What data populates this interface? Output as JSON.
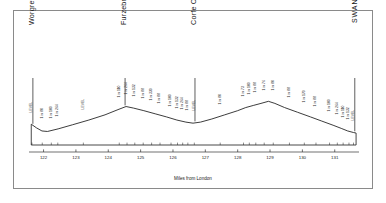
{
  "figure": {
    "background_color": "#ffffff",
    "line_color": "#1a1a1a",
    "border_color": "#8a8a8a"
  },
  "chart_data": {
    "type": "line",
    "title": "",
    "subtitle": "",
    "xlabel": "Miles from London",
    "ylabel": "",
    "grid": false,
    "legend": "none",
    "xlim": [
      121.55,
      131.75
    ],
    "ylim": [
      0,
      120
    ],
    "xticks": [
      "122",
      "123",
      "124",
      "125",
      "126",
      "127",
      "128",
      "129",
      "130",
      "131"
    ],
    "xtick_values": [
      122,
      123,
      124,
      125,
      126,
      127,
      128,
      129,
      130,
      131
    ],
    "series": [
      {
        "name": "Track level",
        "x": [
          121.62,
          121.78,
          121.95,
          122.12,
          122.45,
          122.9,
          123.4,
          123.9,
          124.3,
          124.55,
          124.78,
          125.1,
          125.45,
          125.8,
          126.12,
          126.4,
          126.62,
          126.85,
          127.2,
          127.6,
          128.0,
          128.25,
          128.48,
          128.72,
          128.95,
          129.15,
          129.45,
          129.85,
          130.25,
          130.6,
          130.95,
          131.2,
          131.4,
          131.58,
          131.66
        ],
        "y": [
          40,
          33,
          27,
          26,
          31,
          39,
          48,
          58,
          68,
          74,
          71,
          66,
          60,
          54,
          48,
          44,
          42,
          44,
          50,
          58,
          66,
          72,
          76,
          80,
          84,
          80,
          72,
          63,
          54,
          46,
          38,
          32,
          27,
          24,
          23
        ]
      }
    ],
    "stations": [
      {
        "name": "Worgret Junction",
        "mile": 121.67,
        "style": "title"
      },
      {
        "name": "Furzebrook",
        "mile": 124.52,
        "style": "title"
      },
      {
        "name": "Corfe Castle",
        "mile": 126.68,
        "style": "title"
      },
      {
        "name": "SWANAGE",
        "mile": 131.62,
        "style": "caps"
      }
    ],
    "gradients": [
      {
        "label": "LEVEL",
        "mile": 121.64
      },
      {
        "label": "1 in 80",
        "mile": 121.96
      },
      {
        "label": "1 in 100",
        "mile": 122.24
      },
      {
        "label": "1 in 264",
        "mile": 122.44
      },
      {
        "label": "LEVEL",
        "mile": 123.23
      },
      {
        "label": "1 in 110",
        "mile": 124.34
      },
      {
        "label": "1 in 264",
        "mile": 124.58
      },
      {
        "label": "1 in 132",
        "mile": 124.82
      },
      {
        "label": "1 in 88",
        "mile": 125.08
      },
      {
        "label": "1 in 330",
        "mile": 125.34
      },
      {
        "label": "1 in 88",
        "mile": 125.6
      },
      {
        "label": "1 in 100",
        "mile": 125.94
      },
      {
        "label": "1 in 132",
        "mile": 126.14
      },
      {
        "label": "1 in 264",
        "mile": 126.3
      },
      {
        "label": "1 in 88",
        "mile": 126.46
      },
      {
        "label": "LEVEL",
        "mile": 126.66
      },
      {
        "label": "1 in 80",
        "mile": 127.46
      },
      {
        "label": "1 in 73",
        "mile": 128.18
      },
      {
        "label": "1 in 100",
        "mile": 128.36
      },
      {
        "label": "1 in 88",
        "mile": 128.56
      },
      {
        "label": "1 in 76",
        "mile": 128.82
      },
      {
        "label": "1 in 80",
        "mile": 129.1
      },
      {
        "label": "1 in 88",
        "mile": 129.6
      },
      {
        "label": "1 in 170",
        "mile": 130.06
      },
      {
        "label": "1 in 88",
        "mile": 130.42
      },
      {
        "label": "1 in 100",
        "mile": 130.84
      },
      {
        "label": "1 in 264",
        "mile": 131.08
      },
      {
        "label": "1 in 110",
        "mile": 131.26
      },
      {
        "label": "1 in 132",
        "mile": 131.44
      },
      {
        "label": "LEVEL",
        "mile": 131.58
      }
    ]
  }
}
